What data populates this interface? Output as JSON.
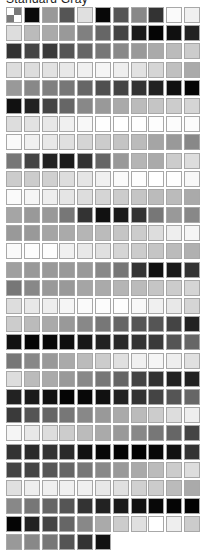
{
  "panel": {
    "title": "Standard Gray"
  },
  "swatch_grid": {
    "columns": 11,
    "no_color_swatch": {
      "position": 0,
      "icon": "transparent-checker-icon"
    },
    "rows": [
      [
        "checker",
        "#0a0a0a",
        "#999999",
        "#555555",
        "#e0e0e0",
        "#080808",
        "#555555",
        "#888888",
        "#333333",
        "#fafafa",
        "#f0f0f0"
      ],
      [
        "#dddddd",
        "#bbbbbb",
        "#aaaaaa",
        "#999999",
        "#808080",
        "#666666",
        "#444444",
        "#1a1a1a",
        "#050505",
        "#101010",
        "#222222"
      ],
      [
        "#333333",
        "#444444",
        "#3a3a3a",
        "#555555",
        "#666666",
        "#777777",
        "#888888",
        "#999999",
        "#aaaaaa",
        "#bbbbbb",
        "#cccccc"
      ],
      [
        "#dddddd",
        "#dddddd",
        "#e2e2e2",
        "#e8e8e8",
        "#f0f0f0",
        "#f5f5f5",
        "#eeeeee",
        "#e2e2e2",
        "#d5d5d5",
        "#c0c0c0",
        "#aaaaaa"
      ],
      [
        "#999999",
        "#888888",
        "#808080",
        "#777777",
        "#666666",
        "#505050",
        "#444444",
        "#333333",
        "#222222",
        "#101010",
        "#050505"
      ],
      [
        "#111111",
        "#222222",
        "#444444",
        "#666666",
        "#888888",
        "#999999",
        "#aaaaaa",
        "#bbbbbb",
        "#c5c5c5",
        "#cccccc",
        "#d5d5d5"
      ],
      [
        "#dddddd",
        "#e2e2e2",
        "#e8e8e8",
        "#f0f0f0",
        "#f8f8f8",
        "#fefefe",
        "#ffffff",
        "#fefefe",
        "#fdfdfd",
        "#fcfcfc",
        "#fbfbfb"
      ],
      [
        "#fafafa",
        "#f0f0f0",
        "#e8e8e8",
        "#e0e0e0",
        "#d5d5d5",
        "#cccccc",
        "#c4c4c4",
        "#bbbbbb",
        "#a5a5a5",
        "#999999",
        "#888888"
      ],
      [
        "#777777",
        "#444444",
        "#222222",
        "#1a1a1a",
        "#333333",
        "#666666",
        "#999999",
        "#b5b5b5",
        "#aaaaaa",
        "#cccccc",
        "#dddddd"
      ],
      [
        "#cccccc",
        "#cccccc",
        "#d0d0d0",
        "#dddddd",
        "#e5e5e5",
        "#f0f0f0",
        "#fafafa",
        "#fdfdfd",
        "#ffffff",
        "#fefefe",
        "#f8f8f8"
      ],
      [
        "#fafafa",
        "#f5f5f5",
        "#eeeeee",
        "#e5e5e5",
        "#dddddd",
        "#d5d5d5",
        "#cccccc",
        "#c5c5c5",
        "#bbbbbb",
        "#bbbbbb",
        "#aaaaaa"
      ],
      [
        "#a5a5a5",
        "#999999",
        "#999999",
        "#777777",
        "#333333",
        "#111111",
        "#1a1a1a",
        "#333333",
        "#777777",
        "#999999",
        "#888888"
      ],
      [
        "#999999",
        "#999999",
        "#a5a5a5",
        "#aaaaaa",
        "#b5b5b5",
        "#bbbbbb",
        "#c5c5c5",
        "#cccccc",
        "#dddddd",
        "#eeeeee",
        "#f5f5f5"
      ],
      [
        "#fafafa",
        "#fcfcfc",
        "#fdfdfd",
        "#f0f0f0",
        "#e8e8e8",
        "#e0e0e0",
        "#d5d5d5",
        "#cccccc",
        "#c5c5c5",
        "#bbbbbb",
        "#b0b0b0"
      ],
      [
        "#a0a0a0",
        "#999999",
        "#999999",
        "#999999",
        "#999999",
        "#888888",
        "#777777",
        "#333333",
        "#111111",
        "#1a1a1a",
        "#333333"
      ],
      [
        "#777777",
        "#888888",
        "#999999",
        "#999999",
        "#a5a5a5",
        "#aaaaaa",
        "#b5b5b5",
        "#bbbbbb",
        "#c5c5c5",
        "#cccccc",
        "#d5d5d5"
      ],
      [
        "#dddddd",
        "#e8e8e8",
        "#eeeeee",
        "#f5f5f5",
        "#fafafa",
        "#fcfcfc",
        "#fdfdfd",
        "#f8f8f8",
        "#f0f0f0",
        "#e8e8e8",
        "#d5d5d5"
      ],
      [
        "#cccccc",
        "#bbbbbb",
        "#aaaaaa",
        "#999999",
        "#888888",
        "#777777",
        "#666666",
        "#555555",
        "#555555",
        "#444444",
        "#222222"
      ],
      [
        "#111111",
        "#050505",
        "#080808",
        "#0f0f0f",
        "#181818",
        "#222222",
        "#2a2a2a",
        "#333333",
        "#3a3a3a",
        "#555555",
        "#666666"
      ],
      [
        "#777777",
        "#888888",
        "#999999",
        "#aaaaaa",
        "#bbbbbb",
        "#cccccc",
        "#e0e0e0",
        "#f0f0f0",
        "#f5f5f5",
        "#eeeeee",
        "#e0e0e0"
      ],
      [
        "#dddddd",
        "#bbbbbb",
        "#aaaaaa",
        "#999999",
        "#888888",
        "#777777",
        "#666666",
        "#444444",
        "#333333",
        "#222222",
        "#222222"
      ],
      [
        "#222222",
        "#1a1a1a",
        "#111111",
        "#050505",
        "#080808",
        "#111111",
        "#222222",
        "#333333",
        "#444444",
        "#555555",
        "#666666"
      ],
      [
        "#3a3a3a",
        "#555555",
        "#666666",
        "#777777",
        "#888888",
        "#999999",
        "#aaaaaa",
        "#bbbbbb",
        "#cccccc",
        "#dddddd",
        "#eeeeee"
      ],
      [
        "#f5f5f5",
        "#e8e8e8",
        "#dddddd",
        "#cccccc",
        "#bbbbbb",
        "#aaaaaa",
        "#999999",
        "#888888",
        "#777777",
        "#666666",
        "#444444"
      ],
      [
        "#333333",
        "#2a2a2a",
        "#333333",
        "#2a2a2a",
        "#111111",
        "#080808",
        "#050505",
        "#020202",
        "#080808",
        "#111111",
        "#333333"
      ],
      [
        "#444444",
        "#444444",
        "#555555",
        "#666666",
        "#777777",
        "#888888",
        "#999999",
        "#aaaaaa",
        "#bbbbbb",
        "#cccccc",
        "#dddddd"
      ],
      [
        "#e0e0e0",
        "#eeeeee",
        "#f0f0f0",
        "#f0f0f0",
        "#f0f0f0",
        "#e8e8e8",
        "#e0e0e0",
        "#d0d0d0",
        "#cccccc",
        "#bbbbbb",
        "#aaaaaa"
      ],
      [
        "#888888",
        "#777777",
        "#666666",
        "#555555",
        "#333333",
        "#222222",
        "#1a1a1a",
        "#111111",
        "#080808",
        "#050505",
        "#020202"
      ],
      [
        "#050505",
        "#222222",
        "#444444",
        "#666666",
        "#888888",
        "#aaaaaa",
        "#cccccc",
        "#e0e0e0",
        "#ffffff",
        "#eeeeee",
        "#cccccc"
      ],
      [
        "#999999",
        "#888888",
        "#777777",
        "#555555",
        "#333333",
        "#111111"
      ]
    ]
  }
}
